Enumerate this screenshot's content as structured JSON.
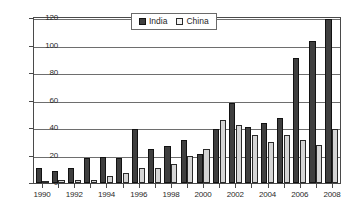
{
  "chart_data": {
    "type": "bar",
    "title": "",
    "subtitle": "",
    "xlabel": "",
    "ylabel": "",
    "ylim": [
      0,
      120
    ],
    "yticks": [
      0,
      20,
      40,
      60,
      80,
      100,
      120
    ],
    "ytick_labels": [
      "0",
      "20",
      "40",
      "60",
      "80",
      "100",
      "120"
    ],
    "grid": "horizontal",
    "legend_position": "top-center-inside",
    "categories": [
      "1990",
      "1991",
      "1992",
      "1993",
      "1994",
      "1995",
      "1996",
      "1997",
      "1998",
      "1999",
      "2000",
      "2001",
      "2002",
      "2003",
      "2004",
      "2005",
      "2006",
      "2007",
      "2008"
    ],
    "xtick_labels_shown": [
      "1990",
      "1992",
      "1994",
      "1996",
      "1998",
      "2000",
      "2002",
      "2004",
      "2006",
      "2008"
    ],
    "series": [
      {
        "name": "India",
        "color": "#3f3f3f",
        "values": [
          11,
          9,
          11,
          18,
          19,
          18,
          39,
          25,
          27,
          31,
          21,
          39,
          58,
          41,
          44,
          47,
          91,
          103,
          119
        ]
      },
      {
        "name": "China",
        "color": "#d5d5d5",
        "values": [
          1,
          2,
          2,
          2,
          5,
          7,
          11,
          11,
          14,
          20,
          25,
          46,
          42,
          35,
          30,
          35,
          31,
          28,
          39
        ]
      }
    ]
  },
  "legend": {
    "items": [
      {
        "label": "India",
        "swatch": "dark-square-icon"
      },
      {
        "label": "China",
        "swatch": "light-square-icon"
      }
    ]
  }
}
